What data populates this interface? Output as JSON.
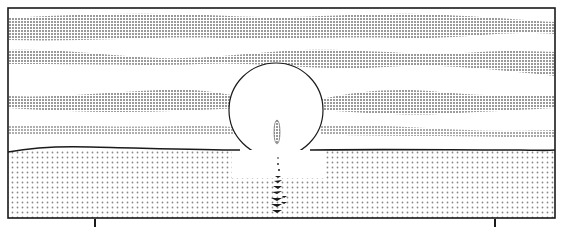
{
  "scene": {
    "description": "Manga panel: sun setting over the sea with screentone cloud bands",
    "colors": {
      "background": "#ffffff",
      "ink": "#1a1a1a",
      "tone": "#b8b8b8",
      "sea_tone": "#cfcfcf"
    },
    "panel": {
      "x": 8,
      "y": 8,
      "width": 547,
      "height": 210
    },
    "horizon_y": 150,
    "sun": {
      "cx": 276,
      "cy": 110,
      "r": 47
    },
    "cloud_bands": 4,
    "crop_marks": [
      {
        "x": 95,
        "y": 219
      },
      {
        "x": 495,
        "y": 219
      }
    ]
  }
}
